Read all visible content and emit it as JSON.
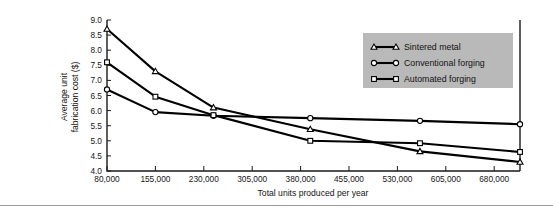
{
  "chart_data": {
    "type": "line",
    "title": "",
    "xlabel": "Total units produced per year",
    "ylabel": "Average unit\nfabrication cost ($)",
    "ylabel_line1": "Average unit",
    "ylabel_line2": "fabrication cost ($)",
    "xlim": [
      80000,
      720000
    ],
    "ylim": [
      4.0,
      9.0
    ],
    "xticks": [
      80000,
      155000,
      230000,
      305000,
      380000,
      455000,
      530000,
      605000,
      680000
    ],
    "xtick_labels": [
      "80,000",
      "155,000",
      "230,000",
      "305,000",
      "380,000",
      "455,000",
      "530,000",
      "605,000",
      "680,000"
    ],
    "yticks": [
      4.0,
      4.5,
      5.0,
      5.5,
      6.0,
      6.5,
      7.0,
      7.5,
      8.0,
      8.5,
      9.0
    ],
    "ytick_labels": [
      "4.0",
      "4.5",
      "5.0",
      "5.5",
      "6.0",
      "6.5",
      "7.0",
      "7.5",
      "8.0",
      "8.5",
      "9.0"
    ],
    "grid": false,
    "legend_position": "upper right",
    "series": [
      {
        "name": "Sintered metal",
        "marker": "triangle",
        "color": "#000000",
        "x": [
          80000,
          155000,
          245000,
          395000,
          565000,
          720000
        ],
        "y": [
          8.7,
          7.3,
          6.1,
          5.38,
          4.65,
          4.3
        ]
      },
      {
        "name": "Conventional forging",
        "marker": "circle",
        "color": "#000000",
        "x": [
          80000,
          155000,
          245000,
          395000,
          565000,
          720000
        ],
        "y": [
          6.7,
          5.95,
          5.83,
          5.75,
          5.66,
          5.55
        ]
      },
      {
        "name": "Automated forging",
        "marker": "square",
        "color": "#000000",
        "x": [
          80000,
          155000,
          245000,
          395000,
          565000,
          720000
        ],
        "y": [
          7.6,
          6.46,
          5.85,
          5.0,
          4.92,
          4.63
        ]
      }
    ]
  },
  "legend": {
    "items": [
      {
        "label": "Sintered metal",
        "marker": "triangle"
      },
      {
        "label": "Conventional forging",
        "marker": "circle"
      },
      {
        "label": "Automated forging",
        "marker": "square"
      }
    ],
    "background_color": "#b9b9b9"
  },
  "colors": {
    "axis": "#1a1a1a",
    "line": "#000000",
    "marker_fill": "#ffffff",
    "legend_bg": "#b9b9b9",
    "rule": "#9a9a9a",
    "page_bg": "#ffffff"
  }
}
